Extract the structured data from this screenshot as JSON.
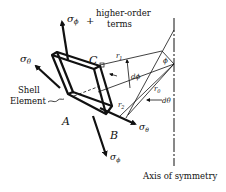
{
  "diagram": {
    "labels": {
      "sigma_phi_top": "σ",
      "sigma_phi_top_sub": "ϕ",
      "plus": "+",
      "higher_order_line1": "higher-order",
      "higher_order_line2": "terms",
      "sigma_theta_left": "σ",
      "sigma_theta_left_sub": "θ",
      "shell_line1": "Shell",
      "shell_line2": "Element",
      "corner_A": "A",
      "corner_B": "B",
      "corner_C": "C",
      "r1": "r",
      "r1_sub": "1",
      "r2": "r",
      "r2_sub": "2",
      "r0": "r",
      "r0_sub": "0",
      "dphi": "dϕ",
      "dtheta": "dθ",
      "phi": "ϕ",
      "sigma_theta_right": "σ",
      "sigma_theta_right_sub": "θ",
      "sigma_phi_bottom": "σ",
      "sigma_phi_bottom_sub": "ϕ",
      "axis": "Axis of symmetry"
    },
    "colors": {
      "ink": "#111111",
      "background": "#ffffff"
    }
  }
}
